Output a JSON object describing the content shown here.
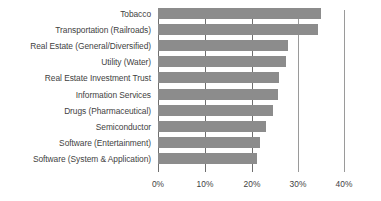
{
  "chart_data": {
    "type": "bar",
    "orientation": "horizontal",
    "title": "",
    "subtitle": "",
    "xlabel": "",
    "ylabel": "",
    "categories": [
      "Tobacco",
      "Transportation (Railroads)",
      "Real Estate (General/Diversified)",
      "Utility (Water)",
      "Real Estate Investment Trust",
      "Information Services",
      "Drugs (Pharmaceutical)",
      "Semiconductor",
      "Software (Entertainment)",
      "Software (System & Application)"
    ],
    "values": [
      35.0,
      34.5,
      28.0,
      27.5,
      26.0,
      25.7,
      24.8,
      23.3,
      22.0,
      21.2
    ],
    "value_unit": "%",
    "xlim": [
      0,
      40
    ],
    "xticks": [
      0,
      10,
      20,
      30,
      40
    ],
    "xtick_labels": [
      "0%",
      "10%",
      "20%",
      "30%",
      "40%"
    ],
    "grid": true,
    "grid_axis": "x",
    "legend": false,
    "legend_position": "none",
    "bar_color": "#8c8c8c",
    "gridline_color": "#6f6f6f",
    "text_color": "#3f3f3f",
    "background_color": "#ffffff"
  }
}
